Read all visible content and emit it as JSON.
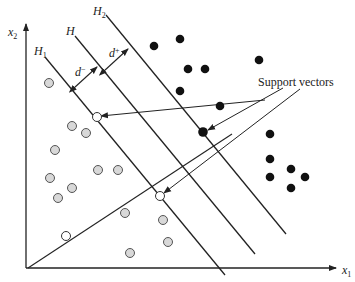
{
  "labels": {
    "y_axis": "x",
    "y_axis_sub": "2",
    "x_axis": "x",
    "x_axis_sub": "1",
    "h1": "H",
    "h1_sub": "1",
    "h": "H",
    "h2": "H",
    "h2_sub": "2",
    "d_minus": "d",
    "d_minus_sup": "−",
    "d_plus": "d",
    "d_plus_sup": "+",
    "support_vectors": "Support vectors"
  },
  "colors": {
    "line": "#222222",
    "negative_fill": "#d8d8d8",
    "positive_fill": "#111111"
  },
  "negative_points": [
    [
      49,
      83
    ],
    [
      97,
      119
    ],
    [
      86,
      127
    ],
    [
      72,
      150
    ],
    [
      98,
      169
    ],
    [
      118,
      170
    ],
    [
      50,
      178
    ],
    [
      73,
      188
    ],
    [
      58,
      198
    ],
    [
      125,
      212
    ],
    [
      163,
      220
    ],
    [
      168,
      242
    ],
    [
      130,
      253
    ]
  ],
  "negative_support_vectors": [
    [
      97,
      119
    ],
    [
      160,
      196
    ],
    [
      66,
      236
    ]
  ],
  "positive_points": [
    [
      153,
      47
    ],
    [
      180,
      39
    ],
    [
      187,
      69
    ],
    [
      205,
      69
    ],
    [
      180,
      91
    ],
    [
      219,
      106
    ],
    [
      260,
      60
    ],
    [
      270,
      133
    ],
    [
      270,
      158
    ],
    [
      290,
      170
    ],
    [
      305,
      178
    ],
    [
      290,
      188
    ],
    [
      270,
      178
    ]
  ],
  "positive_support_vectors": [
    [
      203,
      132
    ]
  ]
}
